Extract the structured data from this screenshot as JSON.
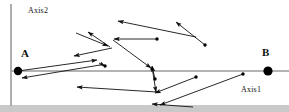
{
  "figure": {
    "title": "",
    "width": 289,
    "height": 112,
    "background_color": "#ffffff"
  },
  "labels": {
    "axis2": "Axis2",
    "axis1": "Axis1",
    "point_a": "A",
    "point_b": "B"
  },
  "colors": {
    "axis_line": "#9a9a9a",
    "vector_line": "#111111",
    "marker_fill": "#000000",
    "bottom_band": "#c9c9c9",
    "text": "#111111"
  },
  "chart_data": {
    "type": "diagram",
    "title": "",
    "xlabel": "Axis1",
    "ylabel": "Axis2",
    "xlim": [
      0,
      289
    ],
    "ylim": [
      112,
      0
    ],
    "grid": false,
    "legend": null,
    "axes": [
      {
        "name": "vertical-axis",
        "label": "Axis2",
        "x1": 11,
        "y1": 4,
        "x2": 11,
        "y2": 106
      },
      {
        "name": "horizontal-axis",
        "label": "Axis1",
        "x1": 11,
        "y1": 71,
        "x2": 289,
        "y2": 71
      }
    ],
    "endpoints": [
      {
        "name": "A",
        "x": 18,
        "y": 71,
        "radius": 4.2
      },
      {
        "name": "B",
        "x": 268,
        "y": 71,
        "radius": 4.6
      }
    ],
    "vectors": [
      {
        "id": "v1",
        "tail": [
          100,
          65
        ],
        "head": [
          22,
          78
        ]
      },
      {
        "id": "v2",
        "tail": [
          18,
          71
        ],
        "head": [
          97,
          60
        ]
      },
      {
        "id": "v3",
        "tail": [
          99,
          63
        ],
        "head": [
          105,
          66
        ],
        "dot_tail": false,
        "dot_head": true
      },
      {
        "id": "v4",
        "tail": [
          112,
          48
        ],
        "head": [
          74,
          56
        ]
      },
      {
        "id": "v5",
        "tail": [
          76,
          33
        ],
        "head": [
          108,
          46
        ]
      },
      {
        "id": "v6",
        "tail": [
          110,
          47
        ],
        "head": [
          88,
          32
        ]
      },
      {
        "id": "v7",
        "tail": [
          157,
          39
        ],
        "head": [
          114,
          39
        ],
        "dot_tail": true
      },
      {
        "id": "v8",
        "tail": [
          196,
          37
        ],
        "head": [
          118,
          21
        ]
      },
      {
        "id": "v9",
        "tail": [
          205,
          45
        ],
        "head": [
          176,
          22
        ],
        "dot_tail": true
      },
      {
        "id": "v10",
        "tail": [
          113,
          40
        ],
        "head": [
          151,
          68
        ],
        "dot_head": false
      },
      {
        "id": "v11",
        "tail": [
          155,
          79
        ],
        "head": [
          152,
          66
        ],
        "dot_tail": true
      },
      {
        "id": "v12",
        "tail": [
          152,
          67
        ],
        "head": [
          156,
          92
        ]
      },
      {
        "id": "v13",
        "tail": [
          157,
          92
        ],
        "head": [
          77,
          87
        ]
      },
      {
        "id": "v14",
        "tail": [
          196,
          77
        ],
        "head": [
          155,
          93
        ],
        "dot_tail": true
      },
      {
        "id": "v15",
        "tail": [
          243,
          74
        ],
        "head": [
          160,
          105
        ],
        "dot_tail": true
      },
      {
        "id": "v16",
        "tail": [
          193,
          107
        ],
        "head": [
          152,
          104
        ]
      }
    ],
    "free_dots": [
      {
        "x": 157,
        "y": 39
      },
      {
        "x": 205,
        "y": 45
      },
      {
        "x": 155,
        "y": 79
      },
      {
        "x": 196,
        "y": 77
      },
      {
        "x": 243,
        "y": 74
      },
      {
        "x": 105,
        "y": 66
      },
      {
        "x": 152,
        "y": 69
      }
    ]
  }
}
